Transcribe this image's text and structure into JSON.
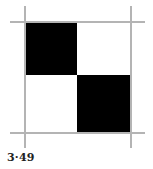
{
  "figure": {
    "caption": "3·49",
    "grid": {
      "rows": 2,
      "cols": 2,
      "cells": [
        {
          "row": 0,
          "col": 0,
          "fill": "#000000"
        },
        {
          "row": 0,
          "col": 1,
          "fill": "#ffffff"
        },
        {
          "row": 1,
          "col": 0,
          "fill": "#ffffff"
        },
        {
          "row": 1,
          "col": 1,
          "fill": "#000000"
        }
      ]
    },
    "colors": {
      "frame_line": "#b4b4b4",
      "dark": "#000000",
      "light": "#ffffff"
    }
  }
}
